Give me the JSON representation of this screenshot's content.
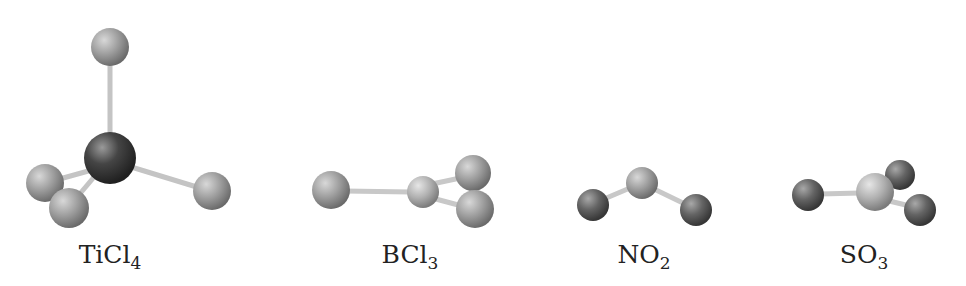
{
  "molecules": [
    {
      "name": "TiCl4",
      "formula_main": "TiCl",
      "formula_sub": "4",
      "label_x": 110
    },
    {
      "name": "BCl3",
      "formula_main": "BCl",
      "formula_sub": "3",
      "label_x": 410
    },
    {
      "name": "NO2",
      "formula_main": "NO",
      "formula_sub": "2",
      "label_x": 644
    },
    {
      "name": "SO3",
      "formula_main": "SO",
      "formula_sub": "3",
      "label_x": 864
    }
  ],
  "colors": {
    "light_atom": "#9a9a9a",
    "dark_atom": "#3e3e3e",
    "mid_atom": "#5e5e5e",
    "bond": "#cfcfcf"
  }
}
